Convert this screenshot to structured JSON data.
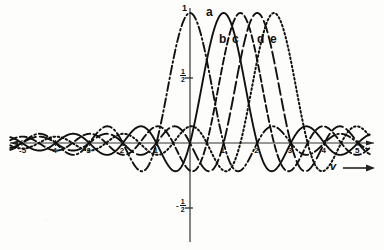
{
  "chart_data": {
    "type": "line",
    "title": "",
    "subtitle": "",
    "xlabel": "v",
    "ylabel": "",
    "xlim": [
      -5.35,
      5.35
    ],
    "ylim": [
      -0.72,
      1.08
    ],
    "grid": false,
    "legend_position": "inline-above-peaks",
    "x_ticks": [
      -5,
      -4,
      -3,
      -2,
      -1,
      1,
      2,
      3,
      4,
      5
    ],
    "x_tick_labels": [
      "-5",
      "4",
      "3",
      "2",
      "1",
      "1",
      "2",
      "3",
      "4",
      "5"
    ],
    "y_ticks": [
      1,
      0.5,
      -0.5
    ],
    "y_tick_labels": [
      "1",
      "1/2",
      "-1/2"
    ],
    "y_tick_label_1": "1",
    "y_tick_label_half_num": "1",
    "y_tick_label_half_den": "2",
    "y_tick_label_neg_half_sign": "-",
    "axis_arrow_label": "v",
    "function_form": "sin(pi(v-s))/(pi(v-s))",
    "series": [
      {
        "name": "a",
        "label": "a",
        "shift": 0,
        "amplitude": 1.0,
        "style": "dash-dot",
        "peak_x": 0,
        "peak_y": 1.0,
        "color": "#111111"
      },
      {
        "name": "b",
        "label": "b",
        "shift": 1.0,
        "amplitude": 1.0,
        "style": "solid",
        "peak_x": 1.0,
        "peak_y": 1.0,
        "color": "#111111"
      },
      {
        "name": "c",
        "label": "c",
        "shift": 1.5,
        "amplitude": 1.0,
        "style": "dashed",
        "peak_x": 1.5,
        "peak_y": 1.0,
        "color": "#111111"
      },
      {
        "name": "d",
        "label": "d",
        "shift": 2.0,
        "amplitude": 1.0,
        "style": "long-dash",
        "peak_x": 2.0,
        "peak_y": 1.0,
        "color": "#111111"
      },
      {
        "name": "e",
        "label": "e",
        "shift": 2.5,
        "amplitude": 1.0,
        "style": "dotted",
        "peak_x": 2.5,
        "peak_y": 1.0,
        "color": "#111111"
      }
    ],
    "curve_label_positions": [
      {
        "label": "a",
        "x": 206,
        "y": 10
      },
      {
        "label": "b",
        "x": 220,
        "y": 36
      },
      {
        "label": "c",
        "x": 233,
        "y": 36
      },
      {
        "label": "d",
        "x": 258,
        "y": 36
      },
      {
        "label": "e",
        "x": 270,
        "y": 36
      }
    ],
    "axes": {
      "origin_px": [
        190,
        143
      ],
      "x_scale_px_per_unit": 33.6,
      "y_scale_px_per_unit": 130,
      "x_axis_y_px": 143,
      "y_axis_x_px": 190
    }
  }
}
